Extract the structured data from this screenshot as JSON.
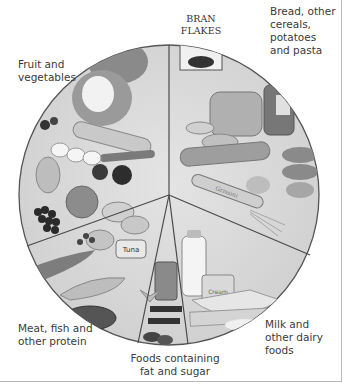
{
  "diagram": {
    "type": "food-plate",
    "segments": [
      {
        "id": "fruit",
        "label_lines": [
          "Fruit and",
          "vegetables"
        ]
      },
      {
        "id": "bread",
        "label_lines": [
          "Bread, other",
          "cereals,",
          "potatoes",
          "and pasta"
        ]
      },
      {
        "id": "meat",
        "label_lines": [
          "Meat, fish and",
          "other protein"
        ]
      },
      {
        "id": "fat",
        "label_lines": [
          "Foods containing",
          "fat and sugar"
        ]
      },
      {
        "id": "milk",
        "label_lines": [
          "Milk and",
          "other dairy",
          "foods"
        ]
      }
    ],
    "item_labels": {
      "cereal_box_line1": "BRAN",
      "cereal_box_line2": "FLAKES",
      "tin": "Tuna",
      "pot": "Cream",
      "breadstick": "Grissini"
    },
    "colors": {
      "plate_fill": "#d9d9d9",
      "plate_rim": "#555555",
      "divider": "#4a4a4a",
      "text": "#3a3a3a"
    }
  }
}
